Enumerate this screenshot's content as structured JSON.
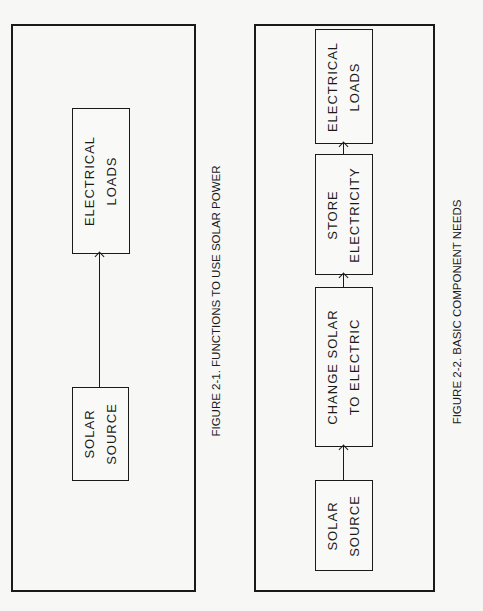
{
  "figure1": {
    "caption": "FIGURE 2-1. FUNCTIONS TO USE SOLAR POWER",
    "boxes": [
      {
        "line1": "ELECTRICAL",
        "line2": "LOADS"
      },
      {
        "line1": "SOLAR",
        "line2": "SOURCE"
      }
    ],
    "flow": "SOLAR SOURCE -> ELECTRICAL LOADS"
  },
  "figure2": {
    "caption": "FIGURE 2-2. BASIC COMPONENT NEEDS",
    "boxes": [
      {
        "line1": "ELECTRICAL",
        "line2": "LOADS"
      },
      {
        "line1": "STORE",
        "line2": "ELECTRICITY"
      },
      {
        "line1": "CHANGE SOLAR",
        "line2": "TO ELECTRIC"
      },
      {
        "line1": "SOLAR",
        "line2": "SOURCE"
      }
    ],
    "flow": "SOLAR SOURCE -> CHANGE SOLAR TO ELECTRIC -> STORE ELECTRICITY -> ELECTRICAL LOADS"
  }
}
